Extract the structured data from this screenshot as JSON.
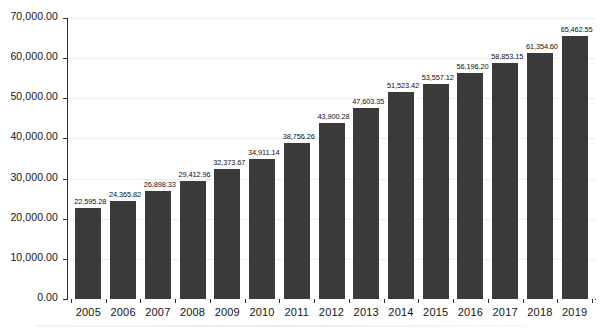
{
  "chart_data": {
    "type": "bar",
    "title": "",
    "subtitle": "",
    "xlabel": "",
    "ylabel": "",
    "ylim": [
      0,
      70000
    ],
    "grid": true,
    "legend": "none",
    "categories": [
      "2005",
      "2006",
      "2007",
      "2008",
      "2009",
      "2010",
      "2011",
      "2012",
      "2013",
      "2014",
      "2015",
      "2016",
      "2017",
      "2018",
      "2019"
    ],
    "values": [
      22595.28,
      24365.82,
      26898.33,
      29412.96,
      32373.67,
      34911.14,
      38756.26,
      43900.28,
      47603.35,
      51523.42,
      53557.12,
      56196.2,
      58853.15,
      61354.6,
      65462.55
    ],
    "data_labels": [
      "22,595.28",
      "24,365.82",
      "26,898.33",
      "29,412.96",
      "32,373.67",
      "34,911.14",
      "38,756.26",
      "43,900.28",
      "47,603.35",
      "51,523.42",
      "53,557.12",
      "56,196.20",
      "58,853.15",
      "61,354.60",
      "65,462.55"
    ],
    "ytick_values": [
      0,
      10000,
      20000,
      30000,
      40000,
      50000,
      60000,
      70000
    ],
    "ytick_labels": [
      "0.00",
      "10,000.00",
      "20,000.00",
      "30,000.00",
      "40,000.00",
      "50,000.00",
      "60,000.00",
      "70,000.00"
    ],
    "bar_color": "#3a3a3a",
    "axis_color": "#2b2b2b",
    "gridline_color": "#ededed",
    "background_color": "#ffffff"
  }
}
